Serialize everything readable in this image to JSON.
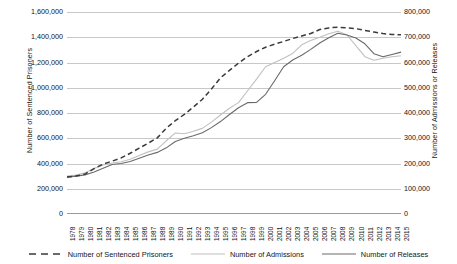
{
  "chart_data": {
    "type": "line",
    "title": "",
    "xlabel": "",
    "ylabel": "Number of Sentenced Prisoners",
    "y2label": "Number of Admissions or Releases",
    "grid": true,
    "legend_position": "bottom",
    "ylim": [
      0,
      1600000
    ],
    "y2lim": [
      0,
      800000
    ],
    "yticks": [
      "0",
      "200,000",
      "400,000",
      "600,000",
      "800,000",
      "1,000,000",
      "1,200,000",
      "1,400,000",
      "1,600,000"
    ],
    "ytick_values": [
      0,
      200000,
      400000,
      600000,
      800000,
      1000000,
      1200000,
      1400000,
      1600000
    ],
    "y2ticks": [
      "0",
      "100,000",
      "200,000",
      "300,000",
      "400,000",
      "500,000",
      "600,000",
      "700,000",
      "800,000"
    ],
    "y2tick_values": [
      0,
      100000,
      200000,
      300000,
      400000,
      500000,
      600000,
      700000,
      800000
    ],
    "categories": [
      "1978",
      "1979",
      "1980",
      "1981",
      "1982",
      "1983",
      "1984",
      "1985",
      "1986",
      "1987",
      "1988",
      "1989",
      "1990",
      "1991",
      "1992",
      "1993",
      "1994",
      "1995",
      "1996",
      "1997",
      "1998",
      "1999",
      "2000",
      "2001",
      "2002",
      "2003",
      "2004",
      "2005",
      "2006",
      "2007",
      "2008",
      "2009",
      "2010",
      "2011",
      "2012",
      "2013",
      "2014",
      "2015"
    ],
    "series": [
      {
        "name": "Number of Sentenced Prisoners",
        "axis": "left",
        "style": "dashed",
        "color": "#3a3a3a",
        "values": [
          294000,
          301000,
          316000,
          360000,
          395000,
          419000,
          444000,
          481000,
          522000,
          561000,
          603000,
          680000,
          739000,
          789000,
          847000,
          909000,
          990000,
          1078000,
          1138000,
          1195000,
          1246000,
          1287000,
          1321000,
          1345000,
          1367000,
          1390000,
          1410000,
          1430000,
          1461000,
          1474000,
          1480000,
          1474000,
          1468000,
          1454000,
          1441000,
          1429000,
          1422000,
          1420000
        ]
      },
      {
        "name": "Number of Admissions",
        "axis": "right",
        "style": "solid",
        "color": "#c0c0c0",
        "values": [
          150000,
          154000,
          163000,
          180000,
          194000,
          202000,
          207000,
          217000,
          232000,
          246000,
          257000,
          290000,
          321000,
          318000,
          328000,
          339000,
          364000,
          392000,
          419000,
          441000,
          488000,
          534000,
          583000,
          600000,
          617000,
          636000,
          670000,
          687000,
          700000,
          714000,
          724000,
          710000,
          667000,
          623000,
          609000,
          617000,
          623000,
          627000
        ]
      },
      {
        "name": "Number of Releases",
        "axis": "right",
        "style": "solid",
        "color": "#6a6a6a",
        "values": [
          146000,
          150000,
          155000,
          166000,
          181000,
          196000,
          200000,
          208000,
          221000,
          234000,
          244000,
          262000,
          287000,
          300000,
          310000,
          322000,
          342000,
          366000,
          394000,
          421000,
          441000,
          442000,
          474000,
          528000,
          583000,
          610000,
          629000,
          652000,
          677000,
          698000,
          716000,
          709000,
          697000,
          674000,
          635000,
          623000,
          632000,
          641000
        ]
      }
    ],
    "legend": [
      "Number of Sentenced Prisoners",
      "Number of Admissions",
      "Number of Releases"
    ]
  }
}
